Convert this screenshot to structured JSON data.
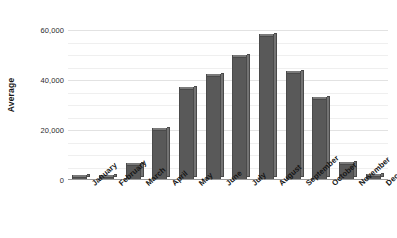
{
  "chart_data": {
    "type": "bar",
    "title": "",
    "subtitle": "",
    "xlabel": "",
    "ylabel": "Average",
    "categories": [
      "January",
      "February",
      "March",
      "April",
      "May",
      "June",
      "July",
      "August",
      "September",
      "October",
      "November",
      "December"
    ],
    "values": [
      1200,
      1400,
      5900,
      20000,
      36500,
      41600,
      49400,
      57600,
      43100,
      32500,
      6500,
      1800
    ],
    "ylim": [
      0,
      65000
    ],
    "y_ticks": [
      0,
      20000,
      40000,
      60000
    ],
    "y_tick_labels": [
      "0",
      "20,000",
      "40,000",
      "60,000"
    ],
    "minor_tick_step": 5000,
    "grid": true,
    "legend": false,
    "legend_position": "none",
    "series": [
      {
        "name": "Average",
        "values": [
          1200,
          1400,
          5900,
          20000,
          36500,
          41600,
          49400,
          57600,
          43100,
          32500,
          6500,
          1800
        ]
      }
    ]
  },
  "colors": {
    "bar_fill": "#595959",
    "bar_top": "#7a7a7a",
    "bar_side": "#737373",
    "bar_border": "#4a4a4a",
    "gridline_major": "#e2e2e2",
    "gridline_minor": "#efefef",
    "baseline": "#9a9a9a",
    "text": "#1a1a1a",
    "background": "#ffffff"
  }
}
